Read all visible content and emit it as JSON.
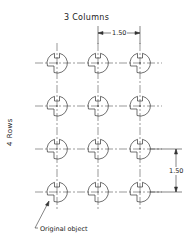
{
  "diagram": {
    "title": "3 Columns",
    "rows_label": "4 Rows",
    "column_spacing_label": "1.50",
    "row_spacing_label": "1.50",
    "original_object_label": "Original object",
    "columns": 3,
    "rows": 4,
    "column_centers_x": [
      57,
      98,
      140
    ],
    "row_centers_y": [
      63,
      106,
      149,
      192
    ],
    "object_shape": "circle with keyhole notches (rectangular slot top, step cutout lower-left) and dashed centerlines",
    "line_color": "#333333",
    "background_color": "#ffffff"
  }
}
